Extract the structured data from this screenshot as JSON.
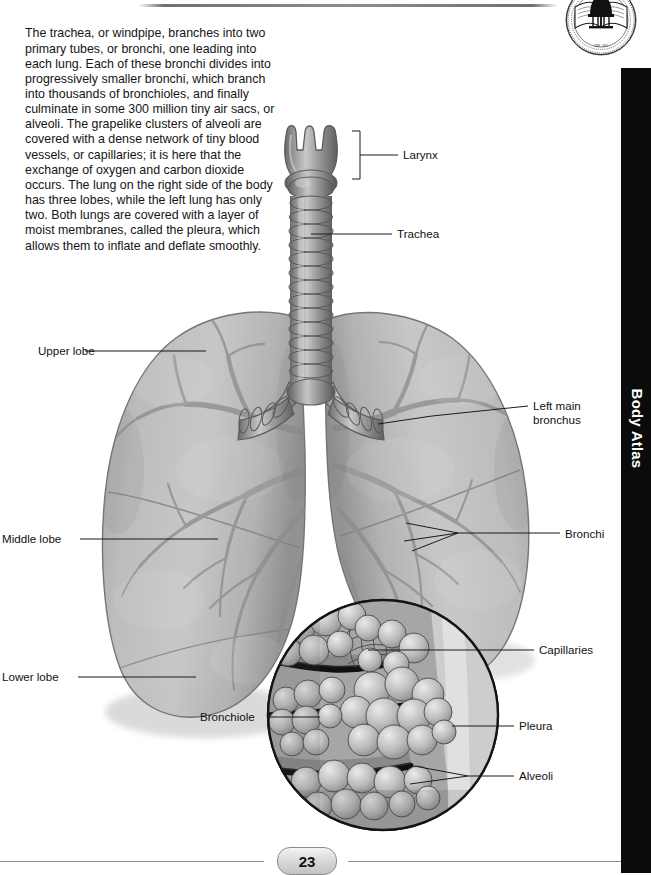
{
  "page": {
    "title": "Body Atlas",
    "number": "23",
    "sidebar_label": "Body Atlas",
    "seal_name": "university-seal"
  },
  "colors": {
    "sidebar_bg": "#0b0b0b",
    "sidebar_text": "#ffffff",
    "text": "#151515",
    "rule": "#8e8e8e",
    "tissue_light": "#cfcfcf",
    "tissue_mid": "#a8a8a8",
    "tissue_dark": "#7d7d7d",
    "airway": "#8a8a8a",
    "outline": "#4a4a4a"
  },
  "intro": {
    "body": "The trachea, or windpipe, branches into two primary tubes, or bronchi, one leading into each lung. Each of these bronchi divides into progressively smaller bronchi, which branch into thousands of bronchioles, and finally culminate in some 300 million tiny air sacs, or alveoli. The grapelike clusters of alveoli are covered with a dense network of tiny blood vessels, or capillaries; it is here that the exchange of oxygen and carbon dioxide occurs. The lung on the right side of the body has three lobes, while the left lung has only two. Both lungs are covered with a layer of moist membranes, called the pleura, which allows them to inflate and deflate smoothly."
  },
  "labels": {
    "larynx": "Larynx",
    "trachea": "Trachea",
    "left_main_bronchus": "Left main bronchus",
    "bronchi": "Bronchi",
    "capillaries": "Capillaries",
    "pleura": "Pleura",
    "alveoli": "Alveoli",
    "upper_lobe": "Upper lobe",
    "middle_lobe": "Middle lobe",
    "lower_lobe": "Lower lobe",
    "bronchiole": "Bronchiole"
  },
  "diagram": {
    "name": "respiratory-system-lungs",
    "caption_subject": "lungs",
    "inset_name": "alveoli-detail-inset"
  }
}
